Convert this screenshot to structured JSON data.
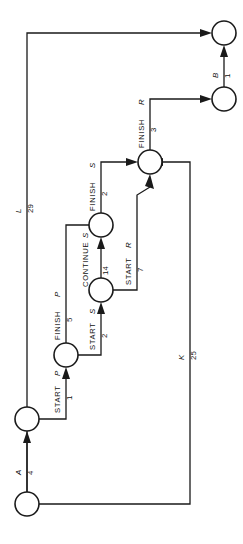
{
  "diagram": {
    "orientation": "rotated-90-ccw",
    "nodes": [
      {
        "id": "n1",
        "name": "node-origin"
      },
      {
        "id": "n2",
        "name": "node-start-p"
      },
      {
        "id": "n3",
        "name": "node-start-s"
      },
      {
        "id": "n4",
        "name": "node-finish-s"
      },
      {
        "id": "n5",
        "name": "node-junction"
      },
      {
        "id": "n6",
        "name": "node-finish-r"
      },
      {
        "id": "n7",
        "name": "node-terminal"
      }
    ],
    "arcs": [
      {
        "id": "a1",
        "activity": "A",
        "duration": "4",
        "style": "resource"
      },
      {
        "id": "a2",
        "activity": "START",
        "resource": "P",
        "duration": "1",
        "style": "activity"
      },
      {
        "id": "a3",
        "activity": "FINISH",
        "resource": "P",
        "duration": "5",
        "style": "activity"
      },
      {
        "id": "a4",
        "activity": "START",
        "resource": "S",
        "duration": "2",
        "style": "activity"
      },
      {
        "id": "a5",
        "activity": "CONTINUE",
        "resource": "S",
        "duration": "14",
        "style": "activity"
      },
      {
        "id": "a6",
        "activity": "FINISH",
        "resource": "S",
        "duration": "2",
        "style": "activity"
      },
      {
        "id": "a7",
        "activity": "START",
        "resource": "R",
        "duration": "7",
        "style": "activity"
      },
      {
        "id": "a8",
        "activity": "FINISH",
        "resource": "R",
        "duration": "3",
        "style": "activity"
      },
      {
        "id": "a9",
        "activity": "B",
        "duration": "1",
        "style": "resource"
      },
      {
        "id": "a10",
        "activity": "K",
        "duration": "25",
        "style": "resource"
      },
      {
        "id": "a11",
        "activity": "L",
        "duration": "29",
        "style": "resource"
      }
    ],
    "labels": {
      "A": "A",
      "A_num": "4",
      "B": "B",
      "B_num": "1",
      "K": "K",
      "K_num": "25",
      "L": "L",
      "L_num": "29",
      "start_p": "START",
      "start_p_res": "P",
      "start_p_num": "1",
      "finish_p": "FINISH",
      "finish_p_res": "P",
      "finish_p_num": "5",
      "start_s": "START",
      "start_s_res": "S",
      "start_s_num": "2",
      "continue_s": "CONTINUE",
      "continue_s_res": "S",
      "continue_s_num": "14",
      "finish_s": "FINISH",
      "finish_s_res": "S",
      "finish_s_num": "2",
      "start_r": "START",
      "start_r_res": "R",
      "start_r_num": "7",
      "finish_r": "FINISH",
      "finish_r_res": "R",
      "finish_r_num": "3"
    },
    "colors": {
      "ink": "#1a1a1a",
      "paper": "#ffffff"
    }
  }
}
